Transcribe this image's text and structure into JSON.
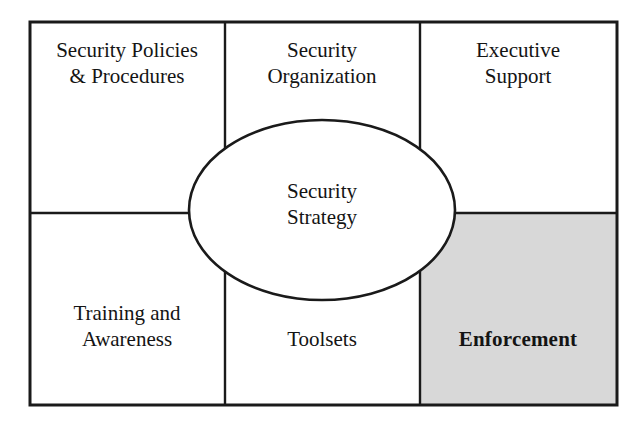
{
  "diagram": {
    "center": {
      "name": "security-strategy-ellipse",
      "lines": [
        "Security",
        "Strategy"
      ],
      "fill": "#ffffff",
      "stroke": "#1a1a1a"
    },
    "frame": {
      "stroke": "#1a1a1a",
      "background": "#ffffff"
    },
    "cells": [
      {
        "id": "security-policies-procedures",
        "lines": [
          "Security Policies",
          "& Procedures"
        ],
        "bold": false,
        "fill": "#ffffff",
        "row": "top",
        "column": "left"
      },
      {
        "id": "security-organization",
        "lines": [
          "Security",
          "Organization"
        ],
        "bold": false,
        "fill": "#ffffff",
        "row": "top",
        "column": "center"
      },
      {
        "id": "executive-support",
        "lines": [
          "Executive",
          "Support"
        ],
        "bold": false,
        "fill": "#ffffff",
        "row": "top",
        "column": "right"
      },
      {
        "id": "training-and-awareness",
        "lines": [
          "Training and",
          "Awareness"
        ],
        "bold": false,
        "fill": "#ffffff",
        "row": "bottom",
        "column": "left"
      },
      {
        "id": "toolsets",
        "lines": [
          "Toolsets"
        ],
        "bold": false,
        "fill": "#ffffff",
        "row": "bottom",
        "column": "center"
      },
      {
        "id": "enforcement",
        "lines": [
          "Enforcement"
        ],
        "bold": true,
        "fill": "#d8d8d8",
        "row": "bottom",
        "column": "right"
      }
    ]
  },
  "labels": {
    "policies_line1": "Security Policies",
    "policies_line2": "& Procedures",
    "organization_line1": "Security",
    "organization_line2": "Organization",
    "executive_line1": "Executive",
    "executive_line2": "Support",
    "training_line1": "Training and",
    "training_line2": "Awareness",
    "toolsets_line1": "Toolsets",
    "enforcement_line1": "Enforcement",
    "strategy_line1": "Security",
    "strategy_line2": "Strategy"
  }
}
